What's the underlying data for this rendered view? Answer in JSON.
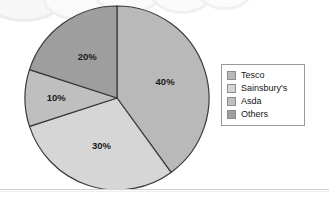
{
  "chart_data": {
    "type": "pie",
    "title": "",
    "categories": [
      "Tesco",
      "Sainsbury's",
      "Asda",
      "Others"
    ],
    "values": [
      40,
      30,
      10,
      20
    ],
    "value_labels": [
      "40%",
      "30%",
      "10%",
      "20%"
    ],
    "units": "percent",
    "start_angle_deg": 0,
    "direction": "clockwise",
    "legend_position": "right",
    "grid": false,
    "colors": [
      "#b9b9b9",
      "#d6d6d6",
      "#bfbfbf",
      "#9e9e9e"
    ],
    "slices": [
      {
        "label": "Tesco",
        "value": 40,
        "value_label": "40%",
        "color": "#b9b9b9",
        "start_deg": 0,
        "end_deg": 144
      },
      {
        "label": "Sainsbury's",
        "value": 30,
        "value_label": "30%",
        "color": "#d6d6d6",
        "start_deg": 144,
        "end_deg": 252
      },
      {
        "label": "Asda",
        "value": 10,
        "value_label": "10%",
        "color": "#bfbfbf",
        "start_deg": 252,
        "end_deg": 288
      },
      {
        "label": "Others",
        "value": 20,
        "value_label": "20%",
        "color": "#9e9e9e",
        "start_deg": 288,
        "end_deg": 360
      }
    ]
  },
  "legend": {
    "items": [
      {
        "label": "Tesco",
        "color": "#b9b9b9"
      },
      {
        "label": "Sainsbury's",
        "color": "#d6d6d6"
      },
      {
        "label": "Asda",
        "color": "#bfbfbf"
      },
      {
        "label": "Others",
        "color": "#9e9e9e"
      }
    ]
  },
  "style": {
    "slice_outline": "#3a3a3a",
    "legend_border": "#9a9a9a",
    "label_color": "#1a1a1a",
    "divider_color": "#d2d2d4",
    "page_background": "#ffffff"
  }
}
